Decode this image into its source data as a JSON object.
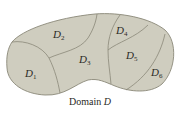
{
  "caption": {
    "prefix": "Domain",
    "symbol": "D"
  },
  "colors": {
    "region_fill": "#cfcdbf",
    "boundary_stroke": "#8a8878",
    "text": "#2a2a26",
    "background": "#ffffff"
  },
  "regions": [
    {
      "id": "D1",
      "letter": "D",
      "subscript": "1"
    },
    {
      "id": "D2",
      "letter": "D",
      "subscript": "2"
    },
    {
      "id": "D3",
      "letter": "D",
      "subscript": "3"
    },
    {
      "id": "D4",
      "letter": "D",
      "subscript": "4"
    },
    {
      "id": "D5",
      "letter": "D",
      "subscript": "5"
    },
    {
      "id": "D6",
      "letter": "D",
      "subscript": "6"
    }
  ]
}
